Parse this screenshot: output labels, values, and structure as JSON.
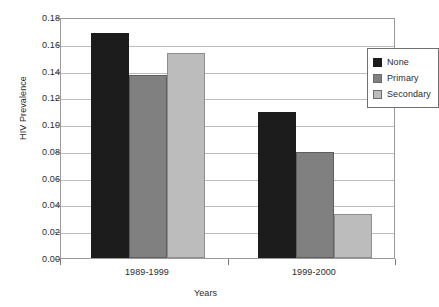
{
  "chart_data": {
    "type": "bar",
    "title": "",
    "xlabel": "Years",
    "ylabel": "HIV Prevalence",
    "categories": [
      "1989-1999",
      "1999-2000"
    ],
    "series": [
      {
        "name": "None",
        "color": "#1c1c1c",
        "values": [
          0.168,
          0.109
        ]
      },
      {
        "name": "Primary",
        "color": "#808080",
        "values": [
          0.137,
          0.079
        ]
      },
      {
        "name": "Secondary",
        "color": "#bcbcbc",
        "values": [
          0.153,
          0.033
        ]
      }
    ],
    "ylim": [
      0.0,
      0.18
    ],
    "ytick_values": [
      0.0,
      0.02,
      0.04,
      0.06,
      0.08,
      0.1,
      0.12,
      0.14,
      0.16,
      0.18
    ],
    "ytick_labels": [
      "0.00",
      "0.02",
      "0.04",
      "0.06",
      "0.08",
      "0.10",
      "0.12",
      "0.14",
      "0.16",
      "0.18"
    ],
    "grid": true,
    "legend_position": "top-right"
  }
}
